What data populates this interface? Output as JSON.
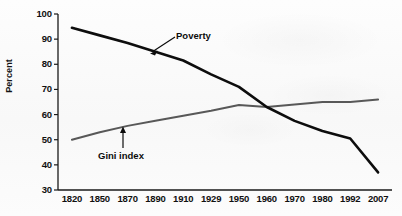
{
  "figure": {
    "background_color": "#fbfbfb",
    "axis_color": "#1a1a1a"
  },
  "chart_data": {
    "type": "line",
    "title": "",
    "xlabel": "",
    "ylabel": "Percent",
    "categories": [
      "1820",
      "1850",
      "1870",
      "1890",
      "1910",
      "1929",
      "1950",
      "1960",
      "1970",
      "1980",
      "1992",
      "2007"
    ],
    "ylim": [
      30,
      100
    ],
    "yticks": [
      30,
      40,
      50,
      60,
      70,
      80,
      90,
      100
    ],
    "ytick_labels": [
      "30",
      "40",
      "50",
      "60",
      "70",
      "80",
      "90",
      "100"
    ],
    "grid": false,
    "legend": "none",
    "series": [
      {
        "name": "Poverty",
        "color": "#0d0d0d",
        "line_width": 2.6,
        "values": [
          94.5,
          91.5,
          88.5,
          85.0,
          81.5,
          76.0,
          71.0,
          63.0,
          57.5,
          53.5,
          50.5,
          37.0
        ]
      },
      {
        "name": "Gini index",
        "color": "#585858",
        "line_width": 2.0,
        "values": [
          50.0,
          53.0,
          55.5,
          57.5,
          59.5,
          61.5,
          63.8,
          63.0,
          64.0,
          65.0,
          65.0,
          66.0
        ]
      }
    ],
    "annotations": [
      {
        "text": "Poverty",
        "target_series": "Poverty",
        "arrow": "down-left"
      },
      {
        "text": "Gini index",
        "target_series": "Gini index",
        "arrow": "up"
      }
    ]
  }
}
